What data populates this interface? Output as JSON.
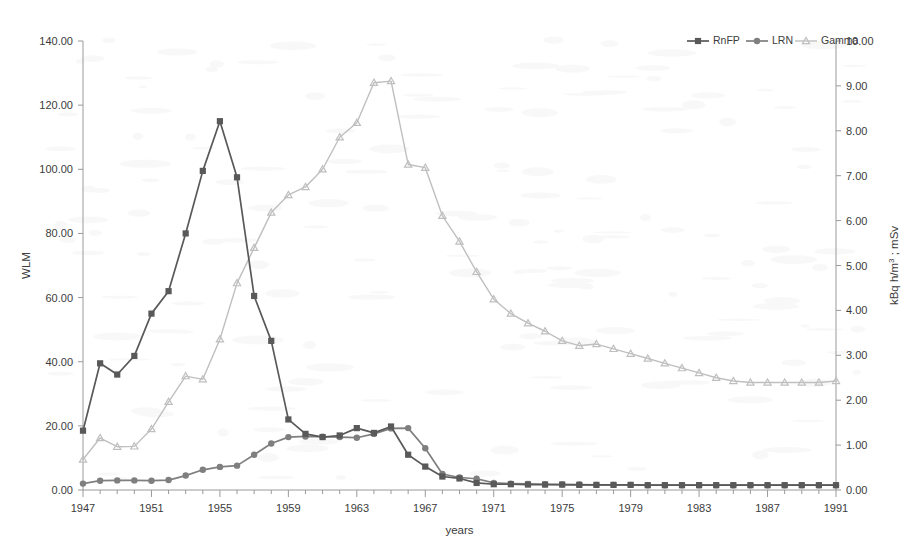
{
  "chart_data": {
    "type": "line",
    "title": "",
    "xlabel": "years",
    "ylabel": "WLM",
    "y2label": "kBq h/m3 ; mSv",
    "y2label_parts": {
      "prefix": "kBq h/m",
      "sup": "3",
      "suffix": " ; mSv"
    },
    "xlim": [
      1947,
      1991
    ],
    "ylim": [
      0,
      140
    ],
    "y2lim": [
      0,
      10
    ],
    "grid": false,
    "legend_position": "top-right",
    "xticks": [
      1947,
      1951,
      1955,
      1959,
      1963,
      1967,
      1971,
      1975,
      1979,
      1983,
      1987,
      1991
    ],
    "xticklabels": [
      "1947",
      "1951",
      "1955",
      "1959",
      "1963",
      "1967",
      "1971",
      "1975",
      "1979",
      "1983",
      "1987",
      "1991"
    ],
    "yticks": [
      0,
      20,
      40,
      60,
      80,
      100,
      120,
      140
    ],
    "yticklabels": [
      "0.00",
      "20.00",
      "40.00",
      "60.00",
      "80.00",
      "100.00",
      "120.00",
      "140.00"
    ],
    "y2ticks": [
      0,
      1,
      2,
      3,
      4,
      5,
      6,
      7,
      8,
      9,
      10
    ],
    "y2ticklabels": [
      "0.00",
      "1.00",
      "2.00",
      "3.00",
      "4.00",
      "5.00",
      "6.00",
      "7.00",
      "8.00",
      "9.00",
      "10.00"
    ],
    "x": [
      1947,
      1948,
      1949,
      1950,
      1951,
      1952,
      1953,
      1954,
      1955,
      1956,
      1957,
      1958,
      1959,
      1960,
      1961,
      1962,
      1963,
      1964,
      1965,
      1966,
      1967,
      1968,
      1969,
      1970,
      1971,
      1972,
      1973,
      1974,
      1975,
      1976,
      1977,
      1978,
      1979,
      1980,
      1981,
      1982,
      1983,
      1984,
      1985,
      1986,
      1987,
      1988,
      1989,
      1990,
      1991
    ],
    "series": [
      {
        "name": "RnFP",
        "axis": "left",
        "color": "#595959",
        "marker": "square",
        "values": [
          18.5,
          39.5,
          36.0,
          41.8,
          55.0,
          62.0,
          80.0,
          99.5,
          115.0,
          97.5,
          60.5,
          46.5,
          22.0,
          17.5,
          16.5,
          17.0,
          19.3,
          17.8,
          19.8,
          11.0,
          7.3,
          4.2,
          3.6,
          2.2,
          1.8,
          1.8,
          1.7,
          1.7,
          1.7,
          1.6,
          1.6,
          1.6,
          1.6,
          1.5,
          1.5,
          1.5,
          1.5,
          1.5,
          1.5,
          1.5,
          1.5,
          1.5,
          1.5,
          1.5,
          1.5
        ]
      },
      {
        "name": "LRN",
        "axis": "left",
        "color": "#7f7f7f",
        "marker": "circle",
        "values": [
          2.0,
          2.9,
          3.0,
          3.0,
          2.9,
          3.1,
          4.5,
          6.3,
          7.2,
          7.6,
          11.0,
          14.5,
          16.5,
          16.7,
          16.6,
          16.5,
          16.3,
          17.5,
          19.2,
          19.3,
          13.0,
          5.0,
          3.9,
          3.5,
          2.2,
          2.0,
          1.9,
          1.8,
          1.7,
          1.7,
          1.6,
          1.6,
          1.6,
          1.5,
          1.5,
          1.5,
          1.5,
          1.5,
          1.5,
          1.5,
          1.5,
          1.5,
          1.5,
          1.5,
          1.5
        ]
      },
      {
        "name": "Gamma",
        "axis": "left",
        "color": "#bfbfbf",
        "marker": "triangle",
        "values": [
          9.5,
          16.2,
          13.5,
          13.6,
          19.0,
          27.5,
          35.5,
          34.5,
          47.0,
          64.5,
          75.5,
          86.5,
          92.0,
          94.5,
          100.0,
          110.0,
          114.5,
          127.0,
          127.5,
          101.5,
          100.5,
          85.5,
          77.5,
          68.0,
          59.5,
          55.0,
          52.0,
          49.5,
          46.5,
          45.0,
          45.5,
          44.0,
          42.5,
          41.0,
          39.5,
          38.0,
          36.5,
          35.0,
          34.0,
          33.5,
          33.5,
          33.5,
          33.5,
          33.5,
          34.0
        ]
      }
    ],
    "legend": [
      {
        "label": "RnFP",
        "color": "#595959",
        "marker": "square"
      },
      {
        "label": "LRN",
        "color": "#7f7f7f",
        "marker": "circle"
      },
      {
        "label": "Gamma",
        "color": "#bfbfbf",
        "marker": "triangle"
      }
    ]
  }
}
